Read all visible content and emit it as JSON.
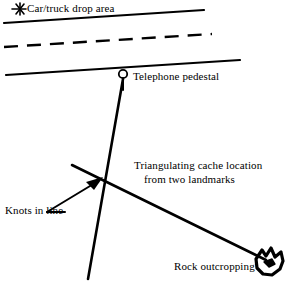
{
  "diagram": {
    "title": "Triangulating cache location from two landmarks",
    "background_color": "#ffffff",
    "ink_color": "#000000",
    "width": 291,
    "height": 288,
    "labels": {
      "car_truck_drop_area": "Car/truck drop area",
      "telephone_pedestal": "Telephone pedestal",
      "triangulating_line1": "Triangulating cache location",
      "triangulating_line2": "from two landmarks",
      "knots_in_line": "Knots in line",
      "rock_outcropping": "Rock outcropping"
    },
    "markers": {
      "drop_area_marker": "asterisk-star-icon",
      "telephone_marker": "circle-on-post-icon",
      "rock_marker": "rock-blob-icon",
      "cache_marker": "arrowhead-icon"
    },
    "features": [
      {
        "name": "road-edge-upper",
        "type": "solid-line"
      },
      {
        "name": "road-center-line",
        "type": "dashed-line"
      },
      {
        "name": "road-edge-lower",
        "type": "solid-line"
      },
      {
        "name": "sight-line-telephone",
        "type": "solid-line"
      },
      {
        "name": "sight-line-rock",
        "type": "solid-line"
      },
      {
        "name": "knots-leader-line",
        "type": "solid-line"
      }
    ]
  }
}
